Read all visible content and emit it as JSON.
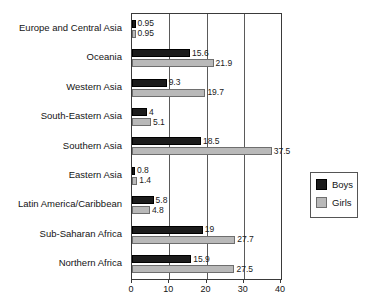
{
  "chart_data": {
    "type": "bar",
    "orientation": "horizontal",
    "title": "",
    "subtitle": "",
    "xlabel": "",
    "ylabel": "",
    "xlim": [
      0,
      40
    ],
    "xticks": [
      "0",
      "10",
      "20",
      "30",
      "40"
    ],
    "grid": "vertical",
    "legend_position": "right",
    "categories": [
      "Europe and Central Asia",
      "Oceania",
      "Western Asia",
      "South-Eastern Asia",
      "Southern Asia",
      "Eastern Asia",
      "Latin America/Caribbean",
      "Sub-Saharan Africa",
      "Northern Africa"
    ],
    "series": [
      {
        "name": "Boys",
        "color": "#1c1c1c",
        "values": [
          0.95,
          15.6,
          9.3,
          4,
          18.5,
          0.8,
          5.8,
          19,
          15.9
        ],
        "labels": [
          "0.95",
          "15.6",
          "9.3",
          "4",
          "18.5",
          "0.8",
          "5.8",
          "19",
          "15.9"
        ]
      },
      {
        "name": "Girls",
        "color": "#b9b9b9",
        "values": [
          0.95,
          21.9,
          19.7,
          5.1,
          37.5,
          1.4,
          4.8,
          27.7,
          27.5
        ],
        "labels": [
          "0.95",
          "21.9",
          "19.7",
          "5.1",
          "37.5",
          "1.4",
          "4.8",
          "27.7",
          "27.5"
        ]
      }
    ]
  },
  "legend": {
    "items": [
      {
        "label": "Boys"
      },
      {
        "label": "Girls"
      }
    ]
  }
}
